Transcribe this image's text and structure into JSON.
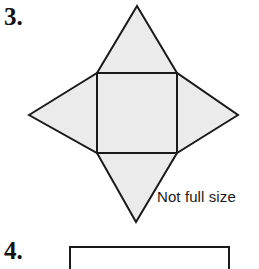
{
  "page": {
    "background_color": "#ffffff",
    "width": 259,
    "height": 269
  },
  "questions": [
    {
      "number_label": "3.",
      "figure": {
        "name": "square-with-four-triangles-net",
        "description": "Net of a square-based pyramid: a central square with an isosceles triangle attached to each of its four sides",
        "fill_color": "#ebebeb",
        "stroke_color": "#1a1a1a",
        "stroke_width": 2,
        "square": {
          "left": 97,
          "top": 73,
          "right": 177,
          "bottom": 153
        },
        "apexes": {
          "top": [
            137,
            6
          ],
          "right": [
            238,
            115
          ],
          "bottom": [
            136,
            222
          ],
          "left": [
            29,
            115
          ]
        }
      },
      "caption": "Not full size"
    },
    {
      "number_label": "4.",
      "figure": {
        "name": "partial-rectangle-outline",
        "description": "Top portion of an unfilled rectangle outline, clipped by the bottom edge of the page",
        "fill_color": "#ffffff",
        "stroke_color": "#1a1a1a",
        "stroke_width": 2,
        "left": 70,
        "top": 246,
        "right": 228
      }
    }
  ]
}
